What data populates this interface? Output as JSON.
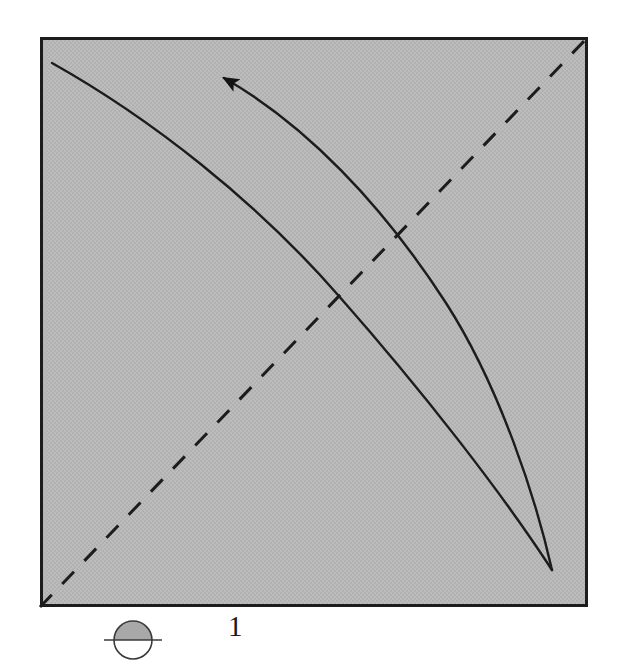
{
  "figure": {
    "label": "1",
    "panel": {
      "name": "phase-plane-panel",
      "fill_color": "#b9b9b9",
      "border_color": "#1c1c1c",
      "border_width": 3,
      "x": 40,
      "y": 37,
      "width": 548,
      "height": 570
    },
    "marker_icon": {
      "name": "half-shaded-circle-icon",
      "description": "circle with shaded upper half and horizontal line through center",
      "fill_top_color": "#a8a8a8",
      "fill_bottom_color": "#ffffff",
      "stroke_color": "#3a3a3a",
      "center_x": 133,
      "center_y": 640,
      "radius": 19,
      "tick_half_length": 29
    }
  },
  "chart_data": {
    "type": "line",
    "title": "",
    "subtitle": "",
    "xlabel": "",
    "ylabel": "",
    "grid": false,
    "legend_position": "none",
    "axis_ranges": {
      "x": [
        0,
        1
      ],
      "y": [
        0,
        1
      ]
    },
    "annotations": [
      {
        "name": "flow-direction-arrow",
        "type": "arrowhead",
        "x": 218,
        "y": 73,
        "direction": "up-left",
        "angle_deg": 203,
        "size": 15,
        "color": "#141414"
      }
    ],
    "series": [
      {
        "name": "diagonal-identity-line",
        "style": "dashed",
        "color": "#1c1c1c",
        "width": 3,
        "dash_pattern": [
          17,
          15
        ],
        "points": [
          [
            40,
            607
          ],
          [
            588,
            37
          ]
        ]
      },
      {
        "name": "upper-nullcline-curve",
        "style": "solid",
        "color": "#1c1c1c",
        "width": 2.4,
        "path": "M 52,63 C 180,140 330,270 438,400 C 500,478 536,540 552,570",
        "start_point": [
          52,
          63
        ],
        "end_point": [
          552,
          570
        ]
      },
      {
        "name": "lower-trajectory-curve-with-arrow",
        "style": "solid",
        "color": "#1c1c1c",
        "width": 2.4,
        "path": "M 222,77 C 300,120 380,200 450,310 C 505,400 538,505 552,570",
        "start_point": [
          222,
          77
        ],
        "end_point": [
          552,
          570
        ],
        "has_arrow": true,
        "arrow_at": "start"
      }
    ],
    "convergence_point": [
      552,
      570
    ]
  }
}
